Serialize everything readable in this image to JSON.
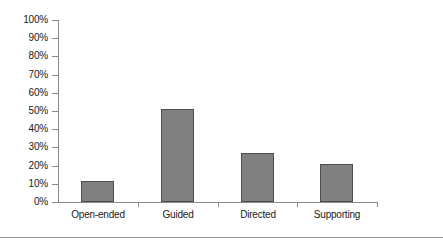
{
  "chart_data": {
    "type": "bar",
    "title": "",
    "xlabel": "",
    "ylabel": "",
    "categories": [
      "Open-ended",
      "Guided",
      "Directed",
      "Supporting"
    ],
    "values": [
      11.5,
      51,
      27,
      21
    ],
    "value_suffix": "%",
    "ylim": [
      0,
      100
    ],
    "y_ticks": [
      0,
      10,
      20,
      30,
      40,
      50,
      60,
      70,
      80,
      90,
      100
    ],
    "y_tick_labels": [
      "0%",
      "10%",
      "20%",
      "30%",
      "40%",
      "50%",
      "60%",
      "70%",
      "80%",
      "90%",
      "100%"
    ],
    "grid": false,
    "legend": false,
    "legend_position": "none",
    "series": [
      {
        "name": "",
        "values": [
          11.5,
          51,
          27,
          21
        ]
      }
    ]
  },
  "style": {
    "bar_fill": "#808080",
    "bar_border": "#4d4d4d",
    "axis_color": "#8a8a8a",
    "text_color": "#1a1a1a",
    "background": "#ffffff",
    "rule_color": "#9a9a9a"
  }
}
